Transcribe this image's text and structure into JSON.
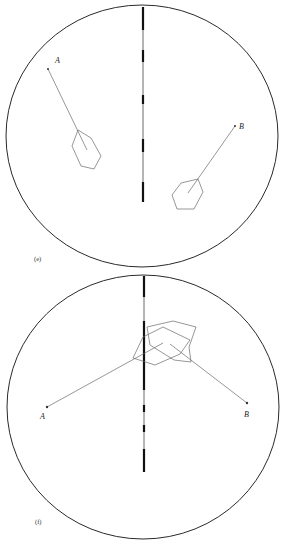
{
  "panels": [
    {
      "id": "e",
      "label": "(e)",
      "point_a_label": "A",
      "point_b_label": "B"
    },
    {
      "id": "f",
      "label": "(f)",
      "point_a_label": "A",
      "point_b_label": "B"
    }
  ]
}
